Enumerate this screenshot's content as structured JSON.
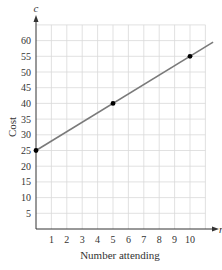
{
  "chart_data": {
    "type": "line",
    "title": "",
    "xlabel": "Number attending",
    "ylabel": "Cost",
    "x_axis_variable": "n",
    "y_axis_variable": "c",
    "x_ticks": [
      "1",
      "2",
      "3",
      "4",
      "5",
      "6",
      "7",
      "8",
      "9",
      "10"
    ],
    "y_ticks": [
      "5",
      "10",
      "15",
      "20",
      "25",
      "30",
      "35",
      "40",
      "45",
      "50",
      "55",
      "60"
    ],
    "xlim": [
      0,
      11
    ],
    "ylim": [
      0,
      65
    ],
    "grid": true,
    "legend": null,
    "series": [
      {
        "name": "c = 25 + 3n",
        "x": [
          0,
          5,
          10
        ],
        "y": [
          25,
          40,
          55
        ],
        "markers": true,
        "line_extends_to": [
          11.5,
          59.5
        ]
      }
    ],
    "colors": {
      "line": "#7a7a7a",
      "point": "#000000",
      "grid": "#d9d9d9",
      "axis": "#333333"
    }
  }
}
